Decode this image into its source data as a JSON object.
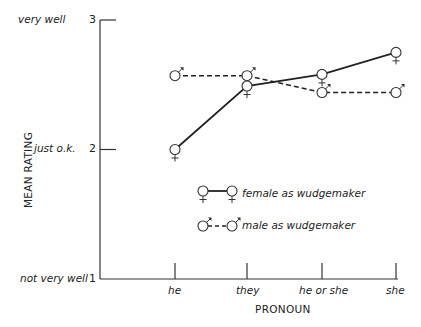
{
  "chart_data": {
    "type": "line",
    "title": "",
    "xlabel": "PRONOUN",
    "ylabel": "MEAN RATING",
    "categories": [
      "he",
      "they",
      "he or she",
      "she"
    ],
    "ylim": [
      1,
      3
    ],
    "yticks": [
      {
        "value": 1,
        "label": "1",
        "desc": "not very well"
      },
      {
        "value": 2,
        "label": "2",
        "desc": "just o.k."
      },
      {
        "value": 3,
        "label": "3",
        "desc": "very well"
      }
    ],
    "grid": false,
    "legend_position": "inside-center",
    "series": [
      {
        "name": "female as wudgemaker",
        "style": "solid",
        "marker": "female-symbol",
        "values": [
          2.0,
          2.49,
          2.58,
          2.75
        ]
      },
      {
        "name": "male as wudgemaker",
        "style": "dashed",
        "marker": "male-symbol",
        "values": [
          2.57,
          2.57,
          2.44,
          2.44
        ]
      }
    ]
  },
  "labels": {
    "y_very_well": "very well",
    "y_just_ok": "just o.k.",
    "y_not_very_well": "not very well",
    "y3": "3",
    "y2": "2",
    "y1": "1",
    "x_he": "he",
    "x_they": "they",
    "x_heorshe": "he or she",
    "x_she": "she",
    "x_title": "PRONOUN",
    "y_title": "MEAN RATING",
    "legend_female": "female as wudgemaker",
    "legend_male": "male as wudgemaker"
  }
}
